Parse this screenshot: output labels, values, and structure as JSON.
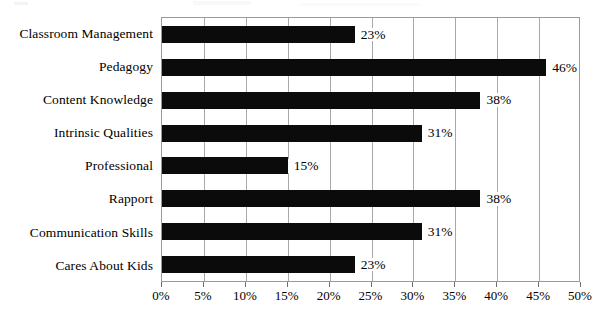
{
  "chart_data": {
    "type": "bar",
    "orientation": "horizontal",
    "title": "",
    "subtitle": "",
    "xlabel": "",
    "ylabel": "",
    "categories": [
      "Classroom Management",
      "Pedagogy",
      "Content Knowledge",
      "Intrinsic Qualities",
      "Professional",
      "Rapport",
      "Communication Skills",
      "Cares About Kids"
    ],
    "values": [
      23,
      46,
      38,
      31,
      15,
      38,
      31,
      23
    ],
    "value_labels": [
      "23%",
      "46%",
      "38%",
      "31%",
      "15%",
      "38%",
      "31%",
      "23%"
    ],
    "xlim": [
      0,
      50
    ],
    "x_tick_values": [
      0,
      5,
      10,
      15,
      20,
      25,
      30,
      35,
      40,
      45,
      50
    ],
    "x_tick_labels": [
      "0%",
      "5%",
      "10%",
      "15%",
      "20%",
      "25%",
      "30%",
      "35%",
      "40%",
      "45%",
      "50%"
    ],
    "grid": "vertical",
    "legend": "none",
    "bar_color": "#0b0b0b",
    "gridline_color": "#a8a8a8",
    "plot_border_color": "#9a9a9a",
    "background_color": "#ffffff"
  }
}
